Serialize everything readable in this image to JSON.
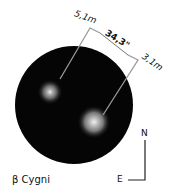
{
  "diagram": {
    "star_name": "β Cygni",
    "separation": "34,3\"",
    "mag_a": "5,1m",
    "mag_b": "3,1m",
    "compass_north": "N",
    "compass_east": "E"
  }
}
